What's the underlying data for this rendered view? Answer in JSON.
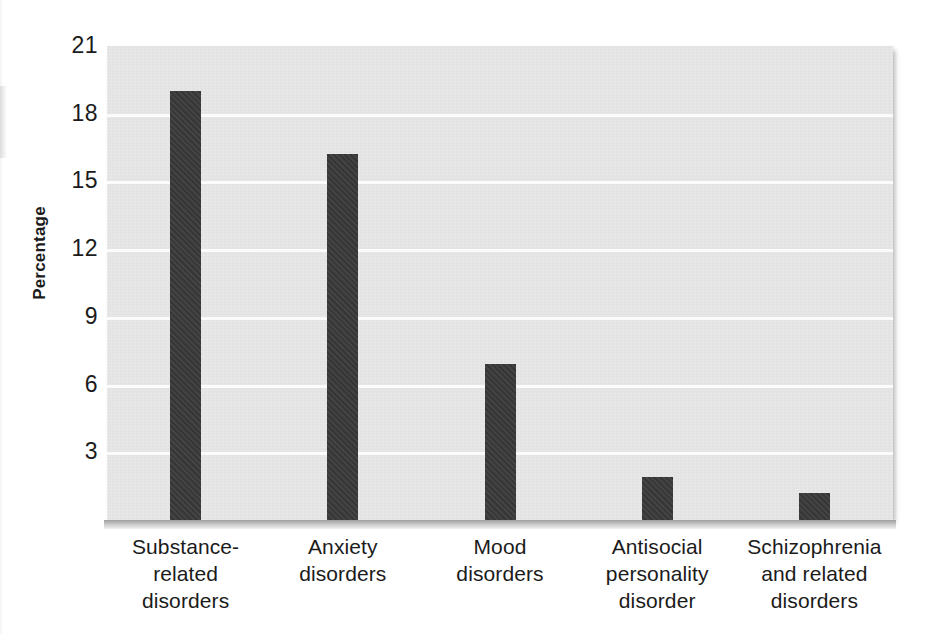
{
  "chart_data": {
    "type": "bar",
    "title": "",
    "subtitle": "",
    "xlabel": "",
    "ylabel": "Percentage",
    "ylim": [
      0,
      21
    ],
    "yticks": [
      21,
      18,
      15,
      12,
      9,
      6,
      3
    ],
    "grid": true,
    "legend": false,
    "legend_position": "none",
    "categories": [
      "Substance-related disorders",
      "Anxiety disorders",
      "Mood disorders",
      "Antisocial personality disorder",
      "Schizophrenia and related disorders"
    ],
    "category_lines": [
      [
        "Substance-",
        "related",
        "disorders"
      ],
      [
        "Anxiety",
        "disorders"
      ],
      [
        "Mood",
        "disorders"
      ],
      [
        "Antisocial",
        "personality",
        "disorder"
      ],
      [
        "Schizophrenia",
        "and related",
        "disorders"
      ]
    ],
    "values": [
      19.0,
      16.2,
      6.9,
      1.9,
      1.2
    ],
    "bar_color": "#393939",
    "plot_background": "#e3e3e3",
    "gridline_color": "#fbfbfb",
    "axis_color": "#9e9e9e"
  }
}
